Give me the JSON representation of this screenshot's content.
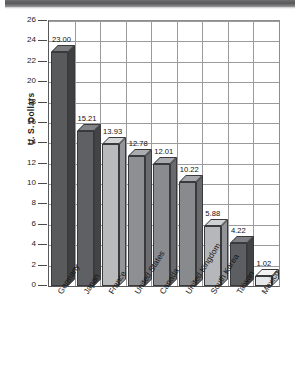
{
  "chart_data": {
    "type": "bar",
    "title": "",
    "subtitle": "",
    "xlabel": "",
    "ylabel": "U. S. Dollars",
    "ylim": [
      0,
      26
    ],
    "ytick_step": 2,
    "yticks": [
      0,
      2,
      4,
      6,
      8,
      10,
      12,
      14,
      16,
      18,
      20,
      22,
      24,
      26
    ],
    "grid": true,
    "legend": null,
    "categories": [
      "Germany",
      "Japan",
      "France",
      "United States",
      "Canada",
      "United Kingdom",
      "South Korea",
      "Taiwan",
      "Mexico"
    ],
    "values": [
      23.0,
      15.21,
      13.93,
      12.78,
      12.01,
      10.22,
      5.88,
      4.22,
      1.02
    ],
    "data_labels": [
      "23.00",
      "15.21",
      "13.93",
      "12.78",
      "12.01",
      "10.22",
      "5.88",
      "4.22",
      "1.02"
    ],
    "bar_colors": [
      "#595a5c",
      "#5f6063",
      "#b9babc",
      "#8e8f92",
      "#8a8b8e",
      "#898a8d",
      "#b6b7ba",
      "#5d5e61",
      "#e6e7e8"
    ],
    "bar_top_colors": [
      "#7c7d80",
      "#828386",
      "#d3d4d6",
      "#abacaf",
      "#a8a9ac",
      "#a6a7aa",
      "#d0d1d3",
      "#7f8083",
      "#f3f3f4"
    ],
    "bar_side_colors": [
      "#3f4042",
      "#434446",
      "#95969a",
      "#6c6d70",
      "#696a6d",
      "#68696c",
      "#939498",
      "#424345",
      "#c6c7c9"
    ],
    "axis_color": "#58585a",
    "grid_color": "#9b9b9d",
    "style": "3d-bar"
  },
  "decor": {
    "top_band_name": "scan-artifact-band"
  }
}
